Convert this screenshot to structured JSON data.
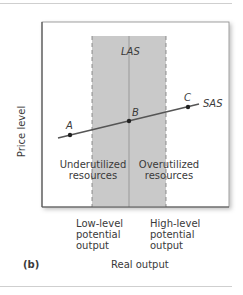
{
  "figure": {
    "panel_label": "(b)",
    "x_axis_label": "Real output",
    "y_axis_label": "Price level",
    "curves": {
      "las": "LAS",
      "sas": "SAS"
    },
    "points": [
      {
        "label": "A"
      },
      {
        "label": "B"
      },
      {
        "label": "C"
      }
    ],
    "regions": {
      "left": "Underutilized resources",
      "left_line1": "Underutilized",
      "left_line2": "resources",
      "right": "Overutilized resources",
      "right_line1": "Overutilized",
      "right_line2": "resources"
    },
    "x_markers": {
      "low": {
        "line1": "Low-level",
        "line2": "potential",
        "line3": "output"
      },
      "high": {
        "line1": "High-level",
        "line2": "potential",
        "line3": "output"
      }
    },
    "colors": {
      "shade": "#c9c9c9",
      "frame": "#555555",
      "curve": "#555555",
      "dashed": "#777777"
    }
  }
}
